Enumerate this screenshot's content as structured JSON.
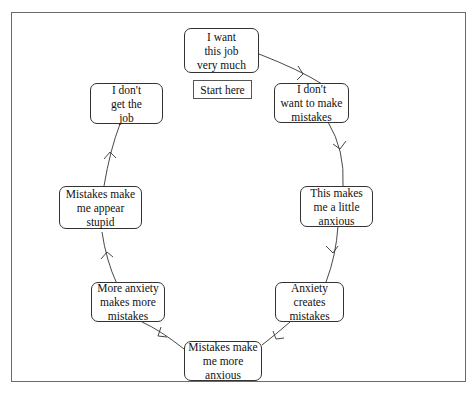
{
  "diagram": {
    "type": "cycle",
    "start_label": "Start here",
    "nodes": [
      {
        "id": "n1",
        "label": "I want\nthis job\nvery much"
      },
      {
        "id": "n2",
        "label": "I don't\nwant to make\nmistakes"
      },
      {
        "id": "n3",
        "label": "This makes\nme a little\nanxious"
      },
      {
        "id": "n4",
        "label": "Anxiety\ncreates\nmistakes"
      },
      {
        "id": "n5",
        "label": "Mistakes make\nme more\nanxious"
      },
      {
        "id": "n6",
        "label": "More anxiety\nmakes more\nmistakes"
      },
      {
        "id": "n7",
        "label": "Mistakes make\nme appear\nstupid"
      },
      {
        "id": "n8",
        "label": "I don't\nget the\njob"
      }
    ],
    "edges": [
      {
        "from": "n1",
        "to": "n2"
      },
      {
        "from": "n2",
        "to": "n3"
      },
      {
        "from": "n3",
        "to": "n4"
      },
      {
        "from": "n4",
        "to": "n5"
      },
      {
        "from": "n5",
        "to": "n6"
      },
      {
        "from": "n6",
        "to": "n7"
      },
      {
        "from": "n7",
        "to": "n8"
      }
    ],
    "colors": {
      "line": "#333333",
      "frame": "#6a6a6a",
      "background": "#ffffff"
    }
  }
}
